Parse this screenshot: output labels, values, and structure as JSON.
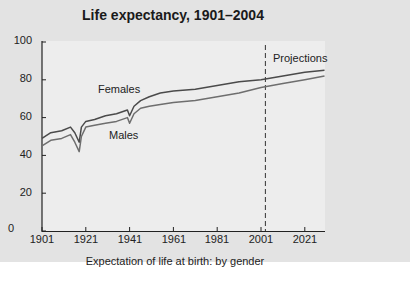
{
  "title": "Life expectancy, 1901–2004",
  "caption": "Expectation of life at birth: by gender",
  "annotations": {
    "projections": "Projections",
    "females": "Females",
    "males": "Males"
  },
  "y_ticks": [
    "0",
    "20",
    "40",
    "60",
    "80",
    "100"
  ],
  "x_ticks": [
    "1901",
    "1921",
    "1941",
    "1961",
    "1981",
    "2001",
    "2021"
  ],
  "colors": {
    "panel": "#e3e3e3",
    "plot": "#ededed",
    "females": "#4a4a4a",
    "males": "#6e6e6e"
  },
  "chart_data": {
    "type": "line",
    "title": "Life expectancy, 1901–2004",
    "xlabel": "Expectation of life at birth: by gender",
    "ylabel": "",
    "ylim": [
      0,
      100
    ],
    "xlim": [
      1901,
      2030
    ],
    "x_ticks": [
      1901,
      1921,
      1941,
      1961,
      1981,
      2001,
      2021
    ],
    "y_ticks": [
      0,
      20,
      40,
      60,
      80,
      100
    ],
    "grid": false,
    "legend": "inline labels",
    "projection_start": 2003,
    "series": [
      {
        "name": "Females",
        "x": [
          1901,
          1905,
          1910,
          1914,
          1916,
          1918,
          1919,
          1921,
          1925,
          1930,
          1935,
          1940,
          1941,
          1943,
          1946,
          1950,
          1955,
          1961,
          1971,
          1981,
          1991,
          2001,
          2011,
          2021,
          2030
        ],
        "values": [
          49,
          52,
          53,
          55,
          52,
          47,
          55,
          58,
          59,
          61,
          62,
          64,
          61,
          66,
          69,
          71,
          73,
          74,
          75,
          77,
          79,
          80,
          82,
          84,
          85
        ]
      },
      {
        "name": "Males",
        "x": [
          1901,
          1905,
          1910,
          1914,
          1916,
          1918,
          1919,
          1921,
          1925,
          1930,
          1935,
          1940,
          1941,
          1943,
          1946,
          1950,
          1955,
          1961,
          1971,
          1981,
          1991,
          2001,
          2011,
          2021,
          2030
        ],
        "values": [
          45,
          48,
          49,
          51,
          47,
          42,
          50,
          55,
          56,
          57,
          58,
          60,
          57,
          62,
          65,
          66,
          67,
          68,
          69,
          71,
          73,
          76,
          78,
          80,
          82
        ]
      }
    ]
  }
}
